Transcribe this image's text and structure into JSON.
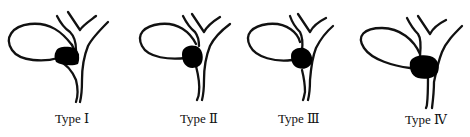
{
  "diagram": {
    "colors": {
      "stroke": "#111111",
      "stone": "#000000",
      "background": "#ffffff"
    },
    "panels": [
      {
        "id": "type-1",
        "label": "Type Ⅰ"
      },
      {
        "id": "type-2",
        "label": "Type Ⅱ"
      },
      {
        "id": "type-3",
        "label": "Type Ⅲ"
      },
      {
        "id": "type-4",
        "label": "Type Ⅳ"
      }
    ]
  }
}
